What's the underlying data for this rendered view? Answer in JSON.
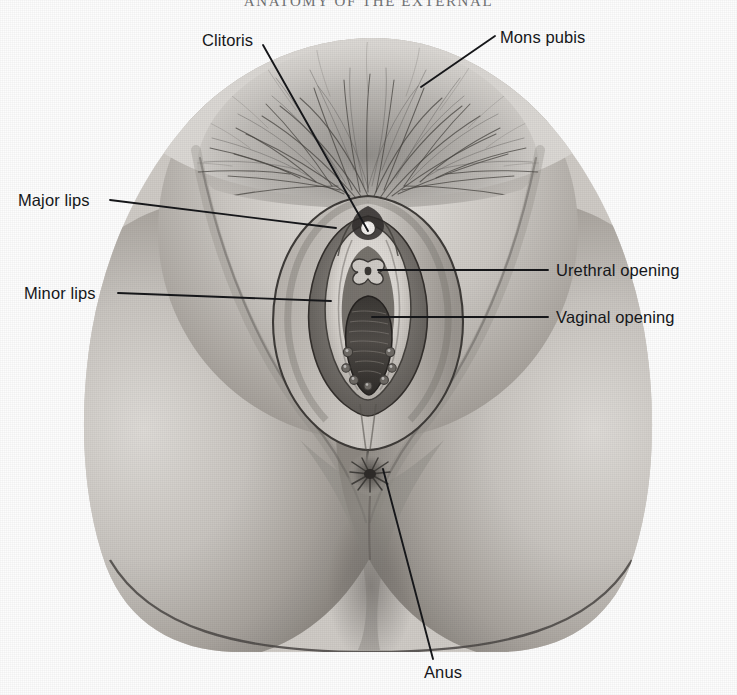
{
  "figure": {
    "title_partial": "ANATOMY OF THE EXTERNAL",
    "caption": "",
    "kind": "grayscale-anatomical-illustration",
    "background_color": "#fdfdfd",
    "ink_color": "#16171a",
    "skin_midtone": "#b9b5b0",
    "shadow_tone": "#6d6a67",
    "dark_tone": "#3b3936"
  },
  "labels": {
    "clitoris": "Clitoris",
    "mons_pubis": "Mons pubis",
    "major_lips": "Major lips",
    "minor_lips": "Minor lips",
    "urethral_opening": "Urethral opening",
    "vaginal_opening": "Vaginal opening",
    "anus": "Anus"
  },
  "leader_lines": [
    {
      "name": "clitoris-leader",
      "from": [
        263,
        45
      ],
      "to": [
        368,
        231
      ]
    },
    {
      "name": "mons-pubis-leader",
      "from": [
        495,
        36
      ],
      "to": [
        421,
        87
      ]
    },
    {
      "name": "major-lips-leader",
      "from": [
        110,
        200
      ],
      "to": [
        336,
        228
      ]
    },
    {
      "name": "minor-lips-leader",
      "from": [
        118,
        293
      ],
      "to": [
        331,
        301
      ]
    },
    {
      "name": "urethral-opening-leader",
      "from": [
        378,
        270
      ],
      "to": [
        548,
        270
      ]
    },
    {
      "name": "vaginal-opening-leader",
      "from": [
        372,
        317
      ],
      "to": [
        548,
        317
      ]
    },
    {
      "name": "anus-leader",
      "from": [
        383,
        469
      ],
      "to": [
        433,
        659
      ]
    }
  ],
  "anatomy_parts": [
    "mons-pubis-hair",
    "major-labia",
    "minor-labia",
    "clitoris",
    "urethral-opening",
    "vaginal-opening",
    "hymenal-caruncles",
    "perineum",
    "anus",
    "inner-thighs"
  ]
}
